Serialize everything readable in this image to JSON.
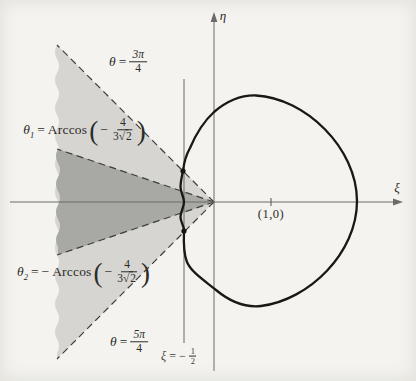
{
  "figure": {
    "axes": {
      "x_label": "ξ",
      "y_label": "η",
      "point_label": "(1,0)"
    },
    "vline": {
      "sym": "ξ",
      "eq": "=",
      "sign": "−",
      "num": "1",
      "den": "2"
    },
    "rays": [
      {
        "sym": "θ",
        "sub": "",
        "eq": "=",
        "neg": "",
        "num": "3π",
        "den": "4"
      },
      {
        "sym": "θ",
        "sub": "1",
        "eq": "=",
        "neg": "",
        "func": "Arccos",
        "inner_sign": "−",
        "num": "4",
        "den_coef": "3",
        "sqrt": "√",
        "radicand": "2"
      },
      {
        "sym": "θ",
        "sub": "2",
        "eq": "=",
        "neg": "−",
        "func": "Arccos",
        "inner_sign": "−",
        "num": "4",
        "den_coef": "3",
        "sqrt": "√",
        "radicand": "2"
      },
      {
        "sym": "θ",
        "sub": "",
        "eq": "=",
        "neg": "",
        "num": "5π",
        "den": "4"
      }
    ],
    "colors": {
      "background": "#f4f3ef",
      "light_wedge": "#d6d5d1",
      "dark_wedge": "#a8a8a4",
      "curve": "#181816",
      "axis": "#6b6b68",
      "dashed": "#3d3d3a"
    }
  }
}
